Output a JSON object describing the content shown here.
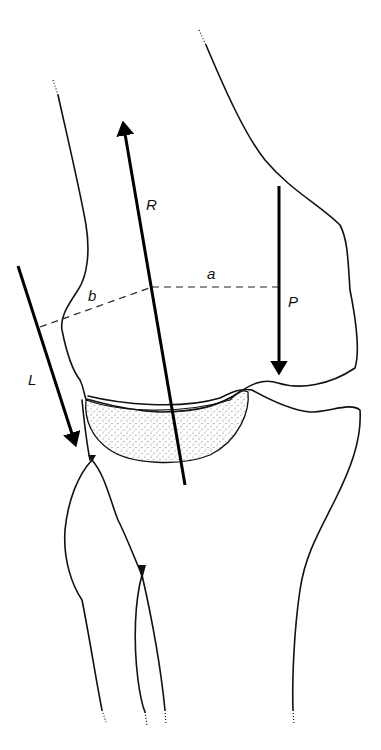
{
  "diagram": {
    "type": "biomechanical knee joint force diagram",
    "labels": {
      "R": "R",
      "P": "P",
      "L": "L",
      "a": "a",
      "b": "b"
    },
    "vectors": [
      {
        "name": "R",
        "description": "joint reaction force"
      },
      {
        "name": "P",
        "description": "applied load"
      },
      {
        "name": "L",
        "description": "ligament/tendon force"
      }
    ],
    "moment_arms": [
      {
        "name": "a",
        "description": "moment arm of P"
      },
      {
        "name": "b",
        "description": "moment arm of L"
      }
    ],
    "colors": {
      "line": "#111111",
      "stipple": "#555555",
      "background": "#ffffff"
    }
  }
}
